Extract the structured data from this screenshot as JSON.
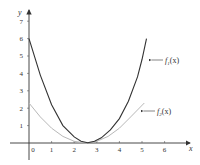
{
  "chart_data": {
    "type": "line",
    "title": "",
    "xlabel": "x",
    "ylabel": "y",
    "xlim": [
      0,
      7
    ],
    "ylim": [
      0,
      7
    ],
    "grid": false,
    "x_ticks": [
      "0",
      "1",
      "2",
      "3",
      "4",
      "5",
      "6"
    ],
    "y_ticks": [
      "1",
      "2",
      "3",
      "4",
      "5",
      "6",
      "7"
    ],
    "series": [
      {
        "name": "f1(x)",
        "color": "#333333",
        "x": [
          0,
          0.5,
          1,
          1.5,
          2,
          2.3,
          2.6,
          2.9,
          3.2,
          3.6,
          4,
          4.4,
          4.8,
          5.0,
          5.2
        ],
        "y": [
          6.0,
          3.9,
          2.2,
          1.0,
          0.35,
          0.1,
          0.02,
          0.1,
          0.3,
          0.75,
          1.4,
          2.4,
          3.8,
          4.8,
          6.0
        ]
      },
      {
        "name": "f2(x)",
        "color": "#b8b8b8",
        "x": [
          0,
          0.5,
          1,
          1.5,
          2,
          2.5,
          3,
          3.5,
          4,
          4.5,
          5.1
        ],
        "y": [
          2.3,
          1.5,
          0.85,
          0.38,
          0.1,
          0.0,
          0.1,
          0.38,
          0.85,
          1.5,
          2.3
        ]
      }
    ],
    "annotations": [
      {
        "text": "f1(x)",
        "points_to": [
          5.05,
          4.6
        ]
      },
      {
        "text": "f2(x)",
        "points_to": [
          5.0,
          1.8
        ]
      }
    ],
    "legend_position": "none"
  },
  "labels": {
    "x_axis": "x",
    "y_axis": "y",
    "f1_base": "f",
    "f1_sub": "1",
    "f1_arg": "(x)",
    "f2_base": "f",
    "f2_sub": "2",
    "f2_arg": "(x)"
  },
  "ticks": {
    "x": [
      "0",
      "1",
      "2",
      "3",
      "4",
      "5",
      "6"
    ],
    "y": [
      "1",
      "2",
      "3",
      "4",
      "5",
      "6",
      "7"
    ]
  },
  "colors": {
    "axis": "#333333",
    "f1": "#333333",
    "f2": "#b8b8b8"
  }
}
